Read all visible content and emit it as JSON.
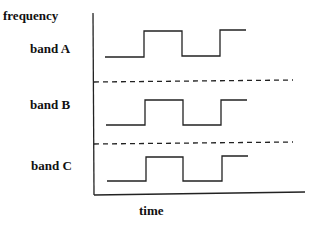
{
  "diagram": {
    "y_axis_label": "frequency",
    "x_axis_label": "time",
    "bands": [
      {
        "label": "band A",
        "label_pos": [
          30,
          48
        ],
        "high_y": 31,
        "low_y": 57
      },
      {
        "label": "band B",
        "label_pos": [
          30,
          104
        ],
        "high_y": 100,
        "low_y": 125
      },
      {
        "label": "band C",
        "label_pos": [
          31,
          165
        ],
        "high_y": 156,
        "low_y": 181
      }
    ],
    "separators_y": [
      81,
      143
    ],
    "line_color": "#222222"
  }
}
